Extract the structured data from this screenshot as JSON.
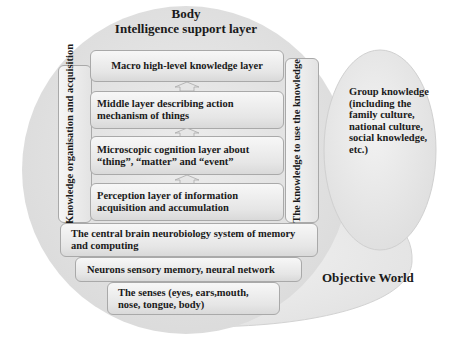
{
  "diagram": {
    "body_title": "Body",
    "intelligence_title": "Intelligence support layer",
    "layers": [
      {
        "id": "macro",
        "label": "Macro high-level knowledge layer"
      },
      {
        "id": "middle",
        "label": "Middle layer describing action mechanism of things"
      },
      {
        "id": "microscopic",
        "label": "Microscopic cognition layer about “thing”, “matter” and “event”"
      },
      {
        "id": "perception",
        "label": "Perception layer of information acquisition and accumulation"
      }
    ],
    "left_vertical": "Knowledge organisation and acquisition",
    "right_vertical": "The knowledge to use the knowledge",
    "base_layers": [
      {
        "id": "central-brain",
        "label": "The central brain neurobiology system of memory and computing"
      },
      {
        "id": "neurons",
        "label": "Neurons sensory memory, neural network"
      },
      {
        "id": "senses",
        "label": "The senses (eyes, ears,mouth, nose, tongue, body)"
      }
    ],
    "group_knowledge": "Group knowledge (including the family culture, national culture, social knowledge, etc.)",
    "objective_world": "Objective World",
    "colors": {
      "body_fill": "#e4e4e4",
      "world_fill": "#ececec",
      "group_fill": "#e8e8e8",
      "box_border": "#a9a9a9"
    }
  }
}
